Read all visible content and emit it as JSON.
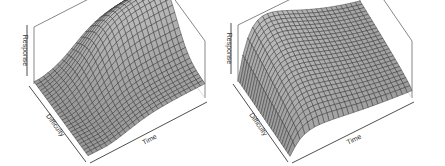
{
  "chart_data": [
    {
      "type": "surface3d",
      "title": "",
      "xlabel": "Time",
      "ylabel": "Difficulty",
      "zlabel": "Response",
      "grid_resolution": 25,
      "shape": "plateau: sigmoid rise in Time and bell-shaped in Difficulty; flat plateau in high-Time region",
      "surface_color": "#a8a8a8",
      "mesh_color": "#2a2a2a",
      "box_color": "#555555",
      "geometry": {
        "front": [
          88,
          158
        ],
        "left": [
          34,
          84
        ],
        "right": [
          205,
          98
        ],
        "back_top": [
          128,
          8
        ],
        "left_top": [
          26,
          27
        ],
        "right_top": [
          214,
          40
        ],
        "height": 57
      }
    },
    {
      "type": "surface3d",
      "title": "",
      "xlabel": "Time",
      "ylabel": "Difficulty",
      "zlabel": "Response",
      "grid_resolution": 25,
      "shape": "ridge: quick rise near Time start, slow decay along Time; arched in Difficulty",
      "surface_color": "#a8a8a8",
      "mesh_color": "#2a2a2a",
      "box_color": "#555555",
      "geometry": {
        "front": [
          68,
          158
        ],
        "left": [
          16,
          82
        ],
        "right": [
          190,
          98
        ],
        "back_top": [
          120,
          8
        ],
        "left_top": [
          18,
          29
        ],
        "right_top": [
          199,
          41
        ],
        "height": 57
      }
    }
  ]
}
